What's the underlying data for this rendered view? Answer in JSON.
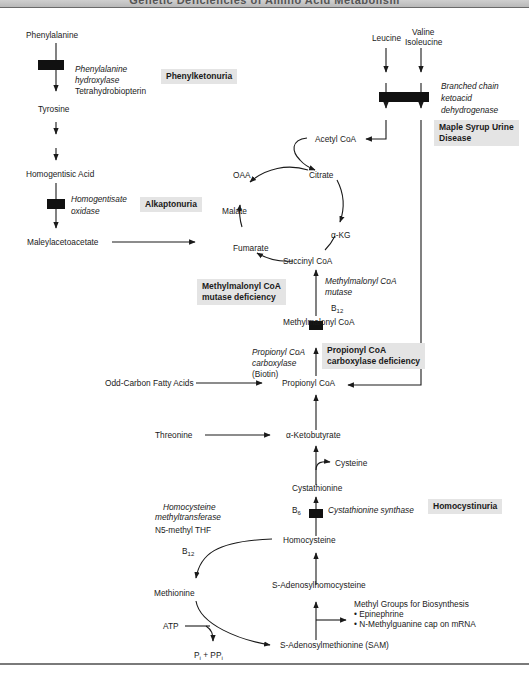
{
  "header": {
    "title": "Genetic Deficiencies of Amino Acid Metabolism"
  },
  "compounds": {
    "phenylalanine": "Phenylalanine",
    "tyrosine": "Tyrosine",
    "homogentisic_acid": "Homogentisic Acid",
    "maleylacetoacetate": "Maleylacetoacetate",
    "leucine": "Leucine",
    "valine": "Valine",
    "isoleucine": "Isoleucine",
    "acetyl_coa": "Acetyl CoA",
    "oaa": "OAA",
    "citrate": "Citrate",
    "malate": "Malate",
    "alpha_kg": "α-KG",
    "fumarate": "Fumarate",
    "succinyl_coa": "Succinyl CoA",
    "methylmalonyl_coa": "Methylmalonyl CoA",
    "propionyl_coa": "Propionyl CoA",
    "odd_carbon_fatty_acids": "Odd-Carbon Fatty Acids",
    "threonine": "Threonine",
    "alpha_ketobutyrate": "α-Ketobutyrate",
    "cysteine": "Cysteine",
    "cystathionine": "Cystathionine",
    "homocysteine": "Homocysteine",
    "s_adenosylhomocysteine": "S-Adenosylhomocysteine",
    "methionine": "Methionine",
    "atp": "ATP",
    "pi_ppi": "Pi + PPi",
    "sam": "S-Adenosylmethionine (SAM)",
    "n5_methyl_thf": "N5-methyl THF"
  },
  "enzymes": {
    "phe_hydroxylase_1": "Phenylalanine",
    "phe_hydroxylase_2": "hydroxylase",
    "tetrahydrobiopterin": "Tetrahydrobiopterin",
    "homogentisate_oxidase_1": "Homogentisate",
    "homogentisate_oxidase_2": "oxidase",
    "bckd_1": "Branched chain",
    "bckd_2": "ketoacid",
    "bckd_3": "dehydrogenase",
    "mmcoa_mutase_1": "Methylmalonyl CoA",
    "mmcoa_mutase_2": "mutase",
    "b12_cofactor": "B",
    "b12_sub": "12",
    "pcc_1": "Propionyl CoA",
    "pcc_2": "carboxylase",
    "pcc_biotin": "(Biotin)",
    "cbs": "Cystathionine synthase",
    "b6_cofactor": "B",
    "b6_sub": "6",
    "hmt_1": "Homocysteine",
    "hmt_2": "methyltransferase",
    "b12_hmt": "B",
    "b12_hmt_sub": "12"
  },
  "diseases": {
    "pku": "Phenylketonuria",
    "alkaptonuria": "Alkaptonuria",
    "msud_1": "Maple Syrup Urine",
    "msud_2": "Disease",
    "mma_1": "Methylmalonyl CoA",
    "mma_2": "mutase deficiency",
    "pcc_def_1": "Propionyl CoA",
    "pcc_def_2": "carboxylase deficiency",
    "homocystinuria": "Homocystinuria"
  },
  "methyl_groups": {
    "title": "Methyl Groups for Biosynthesis",
    "items": [
      "• Epinephrine",
      "• N-Methylguanine cap on mRNA"
    ]
  },
  "colors": {
    "block": "#111111",
    "disease_box": "#e4e4e4",
    "line": "#1a1a1a"
  }
}
